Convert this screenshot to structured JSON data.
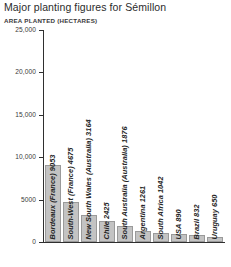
{
  "chart_data": {
    "type": "bar",
    "title": "Major planting figures for Sémillon",
    "subtitle": "AREA PLANTED (HECTARES)",
    "xlabel": "",
    "ylabel": "AREA PLANTED (HECTARES)",
    "ylim": [
      0,
      25000
    ],
    "ytick_step": 5000,
    "yticks": [
      25000,
      20000,
      15000,
      10000,
      5000,
      0
    ],
    "ytick_labels": [
      "25,000",
      "20,000",
      "15,000",
      "10,000",
      "5000",
      "0"
    ],
    "grid": false,
    "legend": false,
    "bar_color": "#c3c3c3",
    "bar_edge_color": "#9a9a9a",
    "axis_color": "#2f2f2f",
    "categories": [
      "Bordeaux (France)",
      "South-West (France)",
      "New South Wales (Australia)",
      "Chile",
      "South Australia (Australia)",
      "Argentina",
      "South Africa",
      "USA",
      "Brazil",
      "Uruguay"
    ],
    "values": [
      9053,
      4675,
      3164,
      2425,
      1876,
      1261,
      1042,
      890,
      832,
      650
    ],
    "bar_labels": [
      "Bordeaux (France) 9053",
      "South-West (France) 4675",
      "New South Wales (Australia) 3164",
      "Chile 2425",
      "South Australia (Australia) 1876",
      "Argentina 1261",
      "South Africa 1042",
      "USA 890",
      "Brazil 832",
      "Uruguay 650"
    ]
  }
}
